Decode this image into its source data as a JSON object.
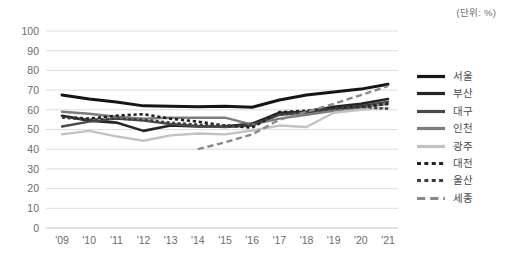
{
  "unit_note": "(단위: %)",
  "legend": {
    "items": [
      {
        "label": "서울",
        "color": "#151515",
        "width": 3.0,
        "dash": "none"
      },
      {
        "label": "부산",
        "color": "#262626",
        "width": 2.6,
        "dash": "none"
      },
      {
        "label": "대구",
        "color": "#4a4a4a",
        "width": 2.4,
        "dash": "none"
      },
      {
        "label": "인천",
        "color": "#7d7d7d",
        "width": 2.4,
        "dash": "none"
      },
      {
        "label": "광주",
        "color": "#c2c2c2",
        "width": 2.4,
        "dash": "none"
      },
      {
        "label": "대전",
        "color": "#232323",
        "width": 2.6,
        "dash": "dotted"
      },
      {
        "label": "울산",
        "color": "#3d3d3d",
        "width": 2.4,
        "dash": "dotted"
      },
      {
        "label": "세종",
        "color": "#8a8a8a",
        "width": 2.4,
        "dash": "dashed"
      }
    ]
  },
  "axes": {
    "y_ticks": [
      "0",
      "10",
      "20",
      "30",
      "40",
      "50",
      "60",
      "70",
      "80",
      "90",
      "100"
    ],
    "x_ticks": [
      "'09",
      "'10",
      "'11",
      "'12",
      "'13",
      "'14",
      "'15",
      "'16",
      "'17",
      "'18",
      "'19",
      "'20",
      "'21"
    ]
  },
  "chart_data": {
    "type": "line",
    "title": "",
    "subtitle": "",
    "xlabel": "",
    "ylabel": "",
    "unit": "%",
    "unit_note": "(단위: %)",
    "grid": true,
    "legend_position": "right",
    "ylim": [
      0,
      100
    ],
    "ystep": 10,
    "categories": [
      "'09",
      "'10",
      "'11",
      "'12",
      "'13",
      "'14",
      "'15",
      "'16",
      "'17",
      "'18",
      "'19",
      "'20",
      "'21"
    ],
    "x": [
      2009,
      2010,
      2011,
      2012,
      2013,
      2014,
      2015,
      2016,
      2017,
      2018,
      2019,
      2020,
      2021
    ],
    "series": [
      {
        "name": "서울",
        "style": "solid",
        "color": "#151515",
        "values": [
          67.5,
          65.5,
          64.0,
          62.0,
          61.8,
          61.5,
          61.8,
          61.3,
          65.0,
          67.5,
          69.0,
          70.5,
          73.0
        ]
      },
      {
        "name": "부산",
        "style": "solid",
        "color": "#262626",
        "values": [
          57.0,
          54.5,
          53.5,
          49.3,
          52.0,
          51.5,
          51.5,
          53.0,
          58.5,
          59.0,
          61.5,
          63.0,
          65.5
        ]
      },
      {
        "name": "대구",
        "style": "solid",
        "color": "#4a4a4a",
        "values": [
          51.5,
          54.0,
          55.5,
          54.5,
          52.8,
          51.8,
          51.3,
          52.0,
          57.5,
          58.5,
          60.5,
          62.0,
          64.0
        ]
      },
      {
        "name": "인천",
        "style": "solid",
        "color": "#7d7d7d",
        "values": [
          59.0,
          58.0,
          56.5,
          55.5,
          56.0,
          56.0,
          56.0,
          52.5,
          55.5,
          57.5,
          59.5,
          61.0,
          63.0
        ]
      },
      {
        "name": "광주",
        "style": "solid",
        "color": "#c2c2c2",
        "values": [
          47.5,
          49.3,
          46.5,
          44.3,
          47.0,
          48.0,
          47.5,
          49.5,
          52.0,
          51.3,
          58.5,
          60.0,
          61.0
        ]
      },
      {
        "name": "대전",
        "style": "dotted",
        "color": "#232323",
        "values": [
          56.5,
          55.5,
          57.0,
          57.8,
          55.5,
          54.0,
          52.0,
          51.0,
          58.8,
          59.5,
          61.0,
          61.5,
          63.0
        ]
      },
      {
        "name": "울산",
        "style": "dotted",
        "color": "#3d3d3d",
        "values": [
          56.0,
          55.0,
          55.5,
          55.0,
          53.5,
          52.5,
          52.0,
          52.5,
          57.5,
          59.0,
          60.5,
          61.5,
          60.5
        ]
      },
      {
        "name": "세종",
        "style": "dashed",
        "color": "#8a8a8a",
        "values": [
          null,
          null,
          null,
          null,
          null,
          40.0,
          43.5,
          47.5,
          55.0,
          59.0,
          63.0,
          67.5,
          72.0
        ]
      }
    ]
  }
}
